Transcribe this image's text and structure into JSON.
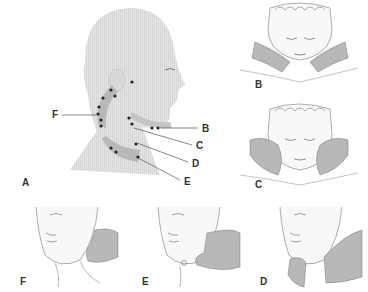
{
  "figure": {
    "main_panel": {
      "label": "A",
      "callouts": [
        {
          "letter": "F",
          "region": "posterior cervical chain"
        },
        {
          "letter": "B",
          "region": "submental / submandibular"
        },
        {
          "letter": "C",
          "region": "anterior cervical (upper)"
        },
        {
          "letter": "D",
          "region": "anterior cervical (mid)"
        },
        {
          "letter": "E",
          "region": "supraclavicular"
        }
      ]
    },
    "side_panels": [
      {
        "label": "B",
        "description": "palpation of submental and submandibular nodes"
      },
      {
        "label": "C",
        "description": "palpation of anterior cervical chain"
      }
    ],
    "bottom_panels": [
      {
        "label": "F",
        "description": "palpation of posterior cervical chain"
      },
      {
        "label": "E",
        "description": "palpation of supraclavicular nodes"
      },
      {
        "label": "D",
        "description": "palpation of anterior neck"
      }
    ],
    "colors": {
      "skin": "#e6e6e6",
      "highlight": "#b8b8b8",
      "node": "#222222",
      "line": "#555555"
    }
  }
}
